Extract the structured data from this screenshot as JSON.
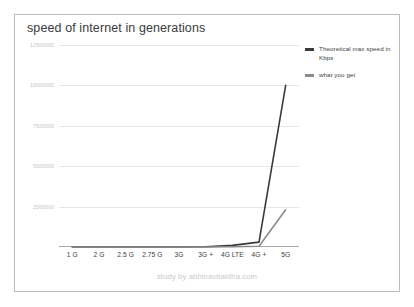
{
  "chart_data": {
    "type": "line",
    "title": "speed of internet in generations",
    "xlabel": "",
    "ylabel": "",
    "categories": [
      "1 G",
      "2 G",
      "2.5 G",
      "2.75 G",
      "3G",
      "3G +",
      "4G LTE",
      "4G +",
      "5G"
    ],
    "series": [
      {
        "name": "Theoretical max speed in Kbps",
        "color": "#3a3a3a",
        "values": [
          2.4,
          9.6,
          40,
          384,
          2000,
          14400,
          100000,
          300000,
          10000000
        ]
      },
      {
        "name": "what you get",
        "color": "#8b8b8b",
        "values": [
          2.4,
          9.6,
          20,
          120,
          384,
          2000,
          20000,
          50000,
          2300000
        ]
      }
    ],
    "ylim": [
      0,
      12500000
    ],
    "yticks": [
      2500000,
      5000000,
      7500000,
      10000000,
      12500000
    ],
    "ytick_labels": [
      "2500000",
      "5000000",
      "7500000",
      "10000000",
      "12500000"
    ],
    "grid": true,
    "legend_position": "right"
  },
  "legend": {
    "items": [
      {
        "label": "Theoretical max speed in Kbps",
        "color": "#3a3a3a"
      },
      {
        "label": "what you get",
        "color": "#8b8b8b"
      }
    ]
  },
  "footer": {
    "credit": "study by abhinavbaldha.com"
  }
}
